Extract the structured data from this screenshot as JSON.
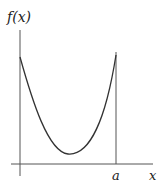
{
  "diagram": {
    "y_axis_label": "f(x)",
    "x_axis_label": "x",
    "endpoint_label": "a",
    "curve": "convex U-shaped function on [0, a]",
    "colors": {
      "line": "#333333",
      "background": "#ffffff"
    }
  }
}
